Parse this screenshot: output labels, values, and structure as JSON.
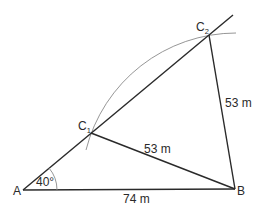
{
  "diagram": {
    "points": {
      "A": {
        "label": "A",
        "x": 23,
        "y": 190
      },
      "B": {
        "label": "B",
        "x": 235,
        "y": 189
      },
      "C1": {
        "label": "C",
        "sub": "1",
        "x": 91,
        "y": 133
      },
      "C2": {
        "label": "C",
        "sub": "2",
        "x": 209,
        "y": 35
      }
    },
    "labels": {
      "angle_A": "40°",
      "side_AB": "74 m",
      "side_C1B": "53 m",
      "side_C2B": "53 m"
    },
    "colors": {
      "line": "#2a2a2a",
      "arc": "#8a8a8a",
      "background": "#ffffff"
    }
  }
}
